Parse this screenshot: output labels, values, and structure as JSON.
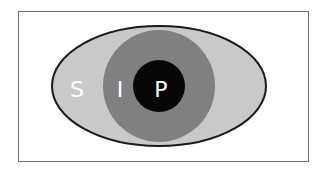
{
  "diagram": {
    "type": "eye-structure",
    "layers": [
      {
        "id": "sclera",
        "label": "S",
        "shape": "ellipse",
        "color": "#c9c9c9"
      },
      {
        "id": "iris",
        "label": "I",
        "shape": "circle",
        "color": "#808080"
      },
      {
        "id": "pupil",
        "label": "P",
        "shape": "circle",
        "color": "#060606"
      }
    ],
    "outline_color": "#1a1a1a",
    "frame_color": "#6e6e6e"
  }
}
